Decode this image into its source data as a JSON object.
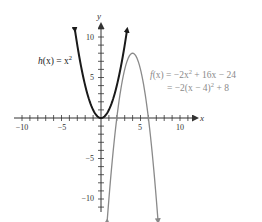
{
  "chart_data": {
    "type": "line",
    "title": "",
    "xlabel": "x",
    "ylabel": "y",
    "xlim": [
      -11,
      12
    ],
    "ylim": [
      -11.5,
      12
    ],
    "xticks": [
      -10,
      -5,
      5,
      10
    ],
    "yticks": [
      10,
      5,
      -5,
      -10
    ],
    "xtick_labels": [
      "−10",
      "−5",
      "5",
      "10"
    ],
    "ytick_labels": [
      "10",
      "5",
      "−5",
      "−10"
    ],
    "grid": false,
    "series": [
      {
        "name": "h(x) = x^2",
        "color": "#1a1a1a",
        "formula": "x^2",
        "x": [
          -3.3,
          -3,
          -2,
          -1,
          0,
          1,
          2,
          3,
          3.3
        ],
        "values": [
          10.9,
          9,
          4,
          1,
          0,
          1,
          4,
          9,
          10.9
        ]
      },
      {
        "name": "f(x) = -2x^2 + 16x - 24 = -2(x - 4)^2 + 8",
        "color": "#888888",
        "formula": "-2(x-4)^2+8",
        "x": [
          0.7,
          1,
          2,
          3,
          4,
          5,
          6,
          7,
          7.3
        ],
        "values": [
          -13.8,
          -10,
          0,
          6,
          8,
          6,
          0,
          -10,
          -13.8
        ]
      }
    ],
    "annotations": [
      {
        "text": "h(x) = x²",
        "near": [
          -3,
          6
        ]
      },
      {
        "text": "f(x) = −2x² + 16x − 24",
        "near": [
          7.5,
          5.5
        ]
      },
      {
        "text": "= −2(x − 4)² + 8",
        "near": [
          7.5,
          4
        ]
      }
    ]
  },
  "labels": {
    "x_axis": "x",
    "y_axis": "y",
    "x_ticks": [
      "−10",
      "−5",
      "5",
      "10"
    ],
    "y_ticks": [
      "10",
      "5",
      "−5",
      "−10"
    ],
    "h_label_prefix": "h",
    "h_label_rest": "(x) = x",
    "h_label_exp": "2",
    "f_line1_prefix": "f",
    "f_line1_a": "(x) = −2x",
    "f_line1_exp": "2",
    "f_line1_b": " + 16x − 24",
    "f_line2_a": "= −2(x − 4)",
    "f_line2_exp": "2",
    "f_line2_b": " + 8"
  },
  "colors": {
    "axis": "#333333",
    "h_curve": "#1a1a1a",
    "f_curve": "#8a8a8a",
    "f_text": "#8a8a8a"
  }
}
